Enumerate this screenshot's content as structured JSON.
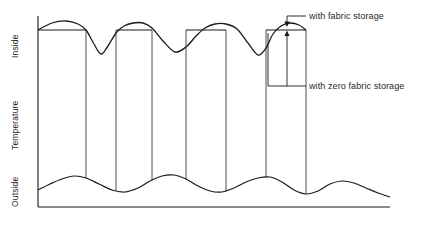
{
  "figure": {
    "axis": {
      "y_title": "Temperature",
      "y_top_label": "Inside",
      "y_bottom_label": "Outside"
    },
    "annotations": [
      {
        "id": "fabric",
        "text": "with fabric storage"
      },
      {
        "id": "zero",
        "text": "with zero fabric storage"
      }
    ]
  },
  "chart_data": {
    "type": "line",
    "title": "",
    "xlabel": "",
    "ylabel": "Temperature",
    "grid": false,
    "legend": "annotations-with-leader-lines",
    "axis_ranges": {
      "x": [
        38,
        390
      ],
      "y_pixels": [
        18,
        207
      ]
    },
    "tick_labels": {
      "y": [
        "Inside",
        "Outside"
      ]
    },
    "series": [
      {
        "name": "inside temperature with fabric storage",
        "description": "upper curve: flat-topped plateaus separated by V-shaped dips",
        "points": [
          [
            38,
            30
          ],
          [
            52,
            23
          ],
          [
            66,
            21
          ],
          [
            78,
            24
          ],
          [
            86,
            30
          ],
          [
            94,
            44
          ],
          [
            101,
            54
          ],
          [
            108,
            46
          ],
          [
            116,
            33
          ],
          [
            124,
            26
          ],
          [
            133,
            23
          ],
          [
            143,
            23
          ],
          [
            152,
            28
          ],
          [
            163,
            41
          ],
          [
            175,
            52
          ],
          [
            186,
            47
          ],
          [
            196,
            36
          ],
          [
            205,
            28
          ],
          [
            215,
            24
          ],
          [
            226,
            24
          ],
          [
            237,
            29
          ],
          [
            248,
            43
          ],
          [
            258,
            55
          ],
          [
            266,
            48
          ],
          [
            273,
            34
          ],
          [
            281,
            26
          ],
          [
            290,
            23
          ],
          [
            299,
            25
          ],
          [
            306,
            30
          ]
        ]
      },
      {
        "name": "inside temperature with zero fabric storage",
        "description": "plateau tops: horizontal segments at plateau base level",
        "plateaus": [
          {
            "x_start": 38,
            "x_end": 86,
            "y": 30
          },
          {
            "x_start": 116,
            "x_end": 152,
            "y": 30
          },
          {
            "x_start": 186,
            "x_end": 226,
            "y": 30
          },
          {
            "x_start": 266,
            "x_end": 306,
            "y": 30
          }
        ]
      },
      {
        "name": "outside temperature",
        "description": "lower sinusoidal curve",
        "points": [
          [
            38,
            190
          ],
          [
            50,
            184
          ],
          [
            62,
            179
          ],
          [
            74,
            176
          ],
          [
            86,
            178
          ],
          [
            99,
            184
          ],
          [
            112,
            190
          ],
          [
            125,
            192
          ],
          [
            138,
            188
          ],
          [
            150,
            181
          ],
          [
            162,
            176
          ],
          [
            174,
            175
          ],
          [
            186,
            179
          ],
          [
            198,
            186
          ],
          [
            210,
            191
          ],
          [
            222,
            192
          ],
          [
            234,
            188
          ],
          [
            246,
            182
          ],
          [
            258,
            178
          ],
          [
            270,
            177
          ],
          [
            282,
            182
          ],
          [
            294,
            190
          ],
          [
            306,
            194
          ],
          [
            318,
            191
          ],
          [
            330,
            184
          ],
          [
            342,
            181
          ],
          [
            354,
            183
          ],
          [
            366,
            188
          ],
          [
            378,
            193
          ],
          [
            390,
            197
          ]
        ]
      }
    ],
    "connector_lines": {
      "description": "vertical lines joining upper plateau edges to the lower curve",
      "x_positions": [
        86,
        116,
        152,
        186,
        226,
        266,
        306
      ],
      "y_top": 30
    },
    "arrows": [
      {
        "name": "fabric-storage-arrow",
        "points_to": "peak of rightmost upper plateau",
        "x": 287,
        "y_from": 16,
        "y_to": 25
      },
      {
        "name": "zero-fabric-storage-arrow",
        "points_to": "plateau base of rightmost plateau",
        "x": 287,
        "y_from": 38,
        "y_to": 30
      }
    ]
  }
}
